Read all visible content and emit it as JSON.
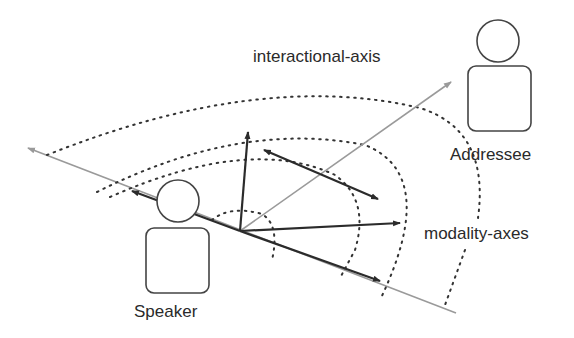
{
  "labels": {
    "interactional_axis": "interactional-axis",
    "addressee": "Addressee",
    "modality_axes": "modality-axes",
    "speaker": "Speaker"
  },
  "colors": {
    "stroke_dark": "#2b2b2b",
    "stroke_gray": "#9a9a9a",
    "background": "#ffffff"
  }
}
